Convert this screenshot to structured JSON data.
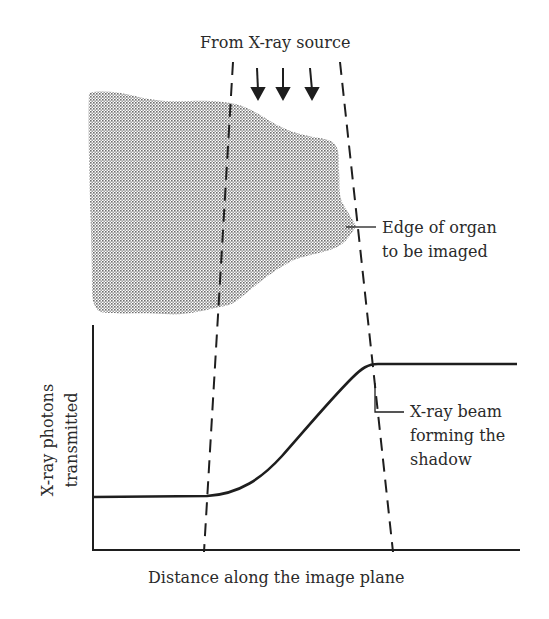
{
  "diagram": {
    "source_label": "From X-ray source",
    "organ_label": "Edge of organ\nto be imaged",
    "beam_label": "X-ray beam\nforming the\nshadow",
    "y_axis_label": "X-ray photons\ntransmitted",
    "x_axis_label": "Distance along the image plane",
    "arrow_count": 3,
    "colors": {
      "ink": "#2a2a2a",
      "organ_fill": "#9a9a9a",
      "background": "#ffffff"
    }
  }
}
